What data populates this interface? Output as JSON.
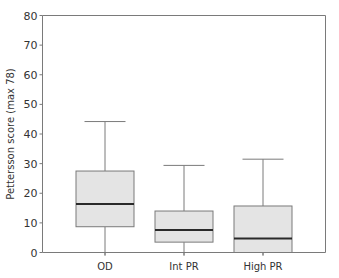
{
  "chart_data": {
    "type": "boxplot",
    "title": "",
    "xlabel": "",
    "ylabel": "Pettersson score (max 78)",
    "ylim": [
      0,
      80
    ],
    "yticks": [
      0,
      10,
      20,
      30,
      40,
      50,
      60,
      70,
      80
    ],
    "grid": false,
    "categories": [
      "OD",
      "Int PR",
      "High PR"
    ],
    "boxes": [
      {
        "category": "OD",
        "whisker_low": 0,
        "q1": 8.7,
        "median": 16.4,
        "q3": 27.5,
        "whisker_high": 44.2
      },
      {
        "category": "Int PR",
        "whisker_low": 0,
        "q1": 3.5,
        "median": 7.6,
        "q3": 14.0,
        "whisker_high": 29.4
      },
      {
        "category": "High PR",
        "whisker_low": 0,
        "q1": 0,
        "median": 4.7,
        "q3": 15.7,
        "whisker_high": 31.5
      }
    ],
    "colors": {
      "box_fill": "#e4e4e4",
      "box_stroke": "#7a7a7a",
      "median": "#2a2a2a",
      "axis": "#7a7a7a"
    }
  }
}
